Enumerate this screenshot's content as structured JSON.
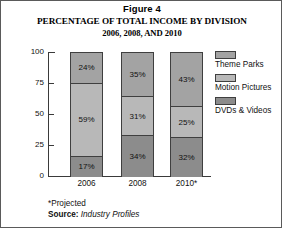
{
  "figure": {
    "label": "Figure 4",
    "title_line1": "PERCENTAGE OF TOTAL INCOME BY DIVISION",
    "title_line2": "2006, 2008, AND 2010"
  },
  "footnotes": {
    "projected": "*Projected",
    "source_label": "Source:",
    "source_value": "Industry Profiles"
  },
  "colors": {
    "theme_parks": "#a3a3a3",
    "motion_pictures": "#b8b8b8",
    "dvds_videos": "#8c8c8c",
    "axis": "#3a3a3a",
    "border": "#5a5a5a"
  },
  "legend": {
    "items": [
      {
        "label": "Theme Parks",
        "color": "#a3a3a3",
        "swatch": "legend-swatch-theme-parks"
      },
      {
        "label": "Motion Pictures",
        "color": "#b8b8b8",
        "swatch": "legend-swatch-motion-pictures"
      },
      {
        "label": "DVDs & Videos",
        "color": "#8c8c8c",
        "swatch": "legend-swatch-dvds-videos"
      }
    ]
  },
  "chart_data": {
    "type": "bar",
    "subtype": "stacked-vertical-100-percent",
    "title": "PERCENTAGE OF TOTAL INCOME BY DIVISION 2006, 2008, AND 2010",
    "xlabel": "",
    "ylabel": "",
    "categories": [
      "2006",
      "2008",
      "2010*"
    ],
    "ylim": [
      0,
      100
    ],
    "yticks": [
      0,
      25,
      50,
      75,
      100
    ],
    "ytick_labels": [
      "0",
      "25",
      "50",
      "75",
      "100"
    ],
    "grid": false,
    "legend_position": "right",
    "stack_order_bottom_to_top": [
      "DVDs & Videos",
      "Motion Pictures",
      "Theme Parks"
    ],
    "series": [
      {
        "name": "Theme Parks",
        "values": [
          24,
          35,
          43
        ],
        "color": "#a3a3a3",
        "labels": [
          "24%",
          "35%",
          "43%"
        ]
      },
      {
        "name": "Motion Pictures",
        "values": [
          59,
          31,
          25
        ],
        "color": "#b8b8b8",
        "labels": [
          "59%",
          "31%",
          "25%"
        ]
      },
      {
        "name": "DVDs & Videos",
        "values": [
          17,
          34,
          32
        ],
        "color": "#8c8c8c",
        "labels": [
          "17%",
          "34%",
          "32%"
        ]
      }
    ],
    "annotations": [
      "*Projected",
      "Source: Industry Profiles"
    ]
  }
}
